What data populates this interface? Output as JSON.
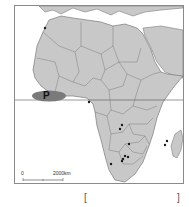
{
  "map": {
    "title": "",
    "region": "Africa",
    "label_p": "P",
    "equator": true,
    "scale_bar": {
      "zero": "0",
      "distance": "2000km"
    },
    "colors": {
      "land": "#c8c8c8",
      "sea": "#ffffff",
      "border": "#6a6a6a",
      "p_ellipse": "#7a7a7a",
      "dot": "#1a1a1a"
    },
    "markers": [
      {
        "name": "north-africa-morocco",
        "x": 44,
        "y": 27
      },
      {
        "name": "central-africa-gabon-congo",
        "x": 88,
        "y": 101
      },
      {
        "name": "zambia-1",
        "x": 121,
        "y": 124
      },
      {
        "name": "zambia-2",
        "x": 119,
        "y": 128
      },
      {
        "name": "zimbabwe",
        "x": 128,
        "y": 143
      },
      {
        "name": "south-africa-1",
        "x": 124,
        "y": 155
      },
      {
        "name": "south-africa-2",
        "x": 127,
        "y": 156
      },
      {
        "name": "south-africa-3",
        "x": 122,
        "y": 158
      },
      {
        "name": "south-africa-4",
        "x": 121,
        "y": 160
      },
      {
        "name": "botswana-south-africa",
        "x": 110,
        "y": 163
      },
      {
        "name": "madagascar-1",
        "x": 166,
        "y": 140
      },
      {
        "name": "madagascar-2",
        "x": 164,
        "y": 144
      }
    ]
  },
  "answer_brackets": {
    "open": "[",
    "close": "]"
  }
}
